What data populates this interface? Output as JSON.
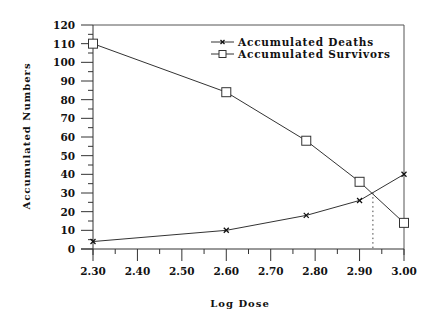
{
  "chart_data": {
    "type": "line",
    "title": "",
    "xlabel": "Log Dose",
    "ylabel": "Accumulated Numbers",
    "x": [
      2.3,
      2.6,
      2.78,
      2.9,
      3.0
    ],
    "series": [
      {
        "name": "Accumulated Deaths",
        "marker": "x",
        "values": [
          4,
          10,
          18,
          26,
          40
        ]
      },
      {
        "name": "Accumulated Survivors",
        "marker": "square",
        "values": [
          110,
          84,
          58,
          36,
          14
        ]
      }
    ],
    "xlim": [
      2.3,
      3.0
    ],
    "ylim": [
      0,
      120
    ],
    "xticks": [
      "2.30",
      "2.40",
      "2.50",
      "2.60",
      "2.70",
      "2.80",
      "2.90",
      "3.00"
    ],
    "yticks": [
      "0",
      "10",
      "20",
      "30",
      "40",
      "50",
      "60",
      "70",
      "80",
      "90",
      "100",
      "110",
      "120"
    ],
    "grid": false,
    "legend_position": "top-right",
    "annotations": [
      {
        "type": "dotted-vertical-line",
        "x": 2.93,
        "note": "intersection of the two curves"
      }
    ]
  }
}
